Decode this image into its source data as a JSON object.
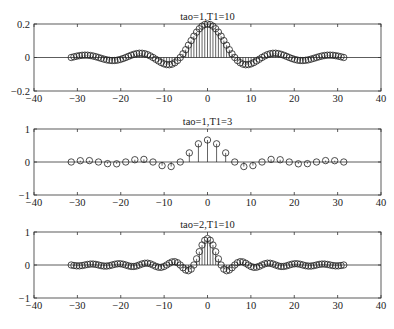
{
  "chart_data": [
    {
      "type": "stem",
      "title": "tao=1,T1=10",
      "xlabel": "",
      "ylabel": "",
      "xlim": [
        -40,
        40
      ],
      "ylim": [
        -0.2,
        0.2
      ],
      "xticks": [
        "-40",
        "-30",
        "-20",
        "-10",
        "0",
        "10",
        "20",
        "30",
        "40"
      ],
      "yticks": [
        "-0.2",
        "0",
        "0.2"
      ],
      "ytick_values": [
        -0.2,
        0,
        0.2
      ],
      "grid": false,
      "marker": "circle-open",
      "n_range": [
        -50,
        50
      ],
      "x_step": 0.6283,
      "symmetric": true,
      "y_half": [
        0.2,
        0.1967,
        0.1871,
        0.1717,
        0.1514,
        0.1273,
        0.1009,
        0.0736,
        0.0468,
        0.0219,
        0,
        -0.0179,
        -0.0312,
        -0.0396,
        -0.0432,
        -0.0424,
        -0.0378,
        -0.0303,
        -0.0208,
        -0.0104,
        0,
        0.0094,
        0.017,
        0.0224,
        0.0252,
        0.0255,
        0.0233,
        0.0191,
        0.0134,
        0.0068,
        0,
        -0.0063,
        -0.0117,
        -0.0156,
        -0.0178,
        -0.0182,
        -0.0168,
        -0.0139,
        -0.0098,
        -0.005,
        0,
        0.0048,
        0.0089,
        0.012,
        0.0138,
        0.0141,
        0.0132,
        0.011,
        0.0078,
        0.004,
        0
      ]
    },
    {
      "type": "stem",
      "title": "tao=1,T1=3",
      "xlabel": "",
      "ylabel": "",
      "xlim": [
        -40,
        40
      ],
      "ylim": [
        -1,
        1
      ],
      "xticks": [
        "-40",
        "-30",
        "-20",
        "-10",
        "0",
        "10",
        "20",
        "30",
        "40"
      ],
      "yticks": [
        "-1",
        "0",
        "1"
      ],
      "ytick_values": [
        -1,
        0,
        1
      ],
      "grid": false,
      "marker": "circle-open",
      "n_range": [
        -15,
        15
      ],
      "x_step": 2.0944,
      "symmetric": true,
      "y_half": [
        0.6667,
        0.5513,
        0.2757,
        0,
        -0.1378,
        -0.1103,
        0,
        0.0788,
        0.0689,
        0,
        -0.0551,
        -0.0501,
        0,
        0.0424,
        0.0394,
        0
      ]
    },
    {
      "type": "stem",
      "title": "tao=2,T1=10",
      "xlabel": "",
      "ylabel": "",
      "xlim": [
        -40,
        40
      ],
      "ylim": [
        -1,
        1
      ],
      "xticks": [
        "-40",
        "-30",
        "-20",
        "-10",
        "0",
        "10",
        "20",
        "30",
        "40"
      ],
      "yticks": [
        "-1",
        "0",
        "1"
      ],
      "ytick_values": [
        -1,
        0,
        1
      ],
      "grid": false,
      "marker": "circle-open",
      "n_range": [
        -50,
        50
      ],
      "x_step": 0.6283,
      "symmetric": true,
      "y_half": [
        0.8,
        0.7484,
        0.6054,
        0.4037,
        0.1871,
        0,
        -0.1247,
        -0.173,
        -0.1514,
        -0.0831,
        0,
        0.068,
        0.1009,
        0.0931,
        0.0534,
        0,
        -0.0468,
        -0.0712,
        -0.0673,
        -0.0394,
        0,
        0.0356,
        0.055,
        0.0526,
        0.0312,
        0,
        -0.0288,
        -0.0448,
        -0.0433,
        -0.0258,
        0,
        0.0242,
        0.0378,
        0.0367,
        0.022,
        0,
        -0.0208,
        -0.0327,
        -0.0319,
        -0.0192,
        0,
        0.0184,
        0.0288,
        0.0282,
        0.017,
        0,
        -0.0165,
        -0.0258,
        -0.0253,
        -0.0153,
        0
      ]
    }
  ],
  "colors": {
    "axes": "#333333",
    "stem": "#222222",
    "marker": "#222222",
    "background": "#ffffff"
  }
}
